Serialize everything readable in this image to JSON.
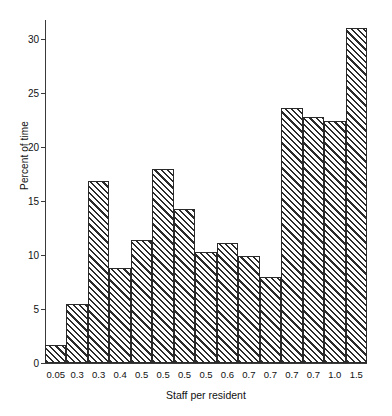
{
  "chart_data": {
    "type": "bar",
    "subtype": "histogram",
    "title": "",
    "xlabel": "Staff per resident",
    "ylabel": "Percent of time",
    "categories": [
      "0.05",
      "0.3",
      "0.3",
      "0.4",
      "0.5",
      "0.5",
      "0.5",
      "0.5",
      "0.6",
      "0.7",
      "0.7",
      "0.7",
      "0.7",
      "1.0",
      "1.5"
    ],
    "values": [
      1.7,
      5.5,
      16.9,
      8.8,
      11.4,
      18.0,
      14.3,
      10.3,
      11.1,
      9.9,
      8.0,
      23.6,
      22.8,
      22.4,
      31.1
    ],
    "ylim": [
      0,
      31.8
    ],
    "yticks": [
      0,
      5,
      10,
      15,
      20,
      25,
      30
    ],
    "ytick_labels": [
      "0",
      "5",
      "10",
      "15",
      "20",
      "25",
      "30"
    ],
    "grid": false,
    "legend": false,
    "bar_fill": "diagonal-hatch",
    "bar_edge_color": "#2a2a2a",
    "background_color": "#ffffff"
  }
}
